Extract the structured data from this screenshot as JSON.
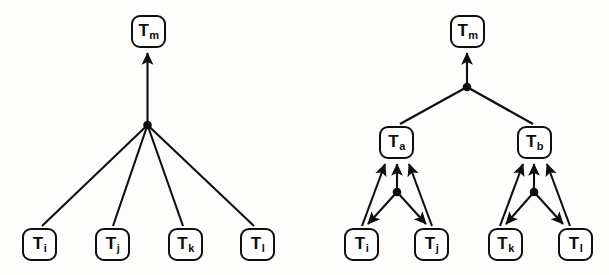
{
  "figure": {
    "type": "diagram",
    "background_color": "#fdfdfc",
    "stroke_color": "#0f0f0f"
  },
  "diagrams": [
    {
      "name": "flat-transaction-tree",
      "root": {
        "id": "left-tm",
        "base": "T",
        "sub": "m",
        "x": 131,
        "y": 15
      },
      "junctions": [
        {
          "id": "left-j1",
          "x": 147,
          "y": 125
        }
      ],
      "leaves": [
        {
          "id": "left-ti",
          "base": "T",
          "sub": "i",
          "x": 22,
          "y": 228
        },
        {
          "id": "left-tj",
          "base": "T",
          "sub": "j",
          "x": 95,
          "y": 228
        },
        {
          "id": "left-tk",
          "base": "T",
          "sub": "k",
          "x": 168,
          "y": 228
        },
        {
          "id": "left-tl",
          "base": "T",
          "sub": "l",
          "x": 240,
          "y": 228
        }
      ]
    },
    {
      "name": "hierarchical-transaction-tree",
      "root": {
        "id": "right-tm",
        "base": "T",
        "sub": "m",
        "x": 450,
        "y": 15
      },
      "junctions": [
        {
          "id": "right-j0",
          "x": 466,
          "y": 87
        },
        {
          "id": "right-ja",
          "x": 397,
          "y": 192
        },
        {
          "id": "right-jb",
          "x": 534,
          "y": 192
        }
      ],
      "intermediates": [
        {
          "id": "right-ta",
          "base": "T",
          "sub": "a",
          "x": 379,
          "y": 126
        },
        {
          "id": "right-tb",
          "base": "T",
          "sub": "b",
          "x": 517,
          "y": 126
        }
      ],
      "leaves": [
        {
          "id": "right-ti",
          "base": "T",
          "sub": "i",
          "x": 344,
          "y": 228
        },
        {
          "id": "right-tj",
          "base": "T",
          "sub": "j",
          "x": 414,
          "y": 228
        },
        {
          "id": "right-tk",
          "base": "T",
          "sub": "k",
          "x": 488,
          "y": 228
        },
        {
          "id": "right-tl",
          "base": "T",
          "sub": "l",
          "x": 558,
          "y": 228
        }
      ]
    }
  ],
  "labels": {
    "left_tm": "T",
    "left_tm_sub": "m",
    "left_ti": "T",
    "left_ti_sub": "i",
    "left_tj": "T",
    "left_tj_sub": "j",
    "left_tk": "T",
    "left_tk_sub": "k",
    "left_tl": "T",
    "left_tl_sub": "l",
    "right_tm": "T",
    "right_tm_sub": "m",
    "right_ta": "T",
    "right_ta_sub": "a",
    "right_tb": "T",
    "right_tb_sub": "b",
    "right_ti": "T",
    "right_ti_sub": "i",
    "right_tj": "T",
    "right_tj_sub": "j",
    "right_tk": "T",
    "right_tk_sub": "k",
    "right_tl": "T",
    "right_tl_sub": "l"
  }
}
